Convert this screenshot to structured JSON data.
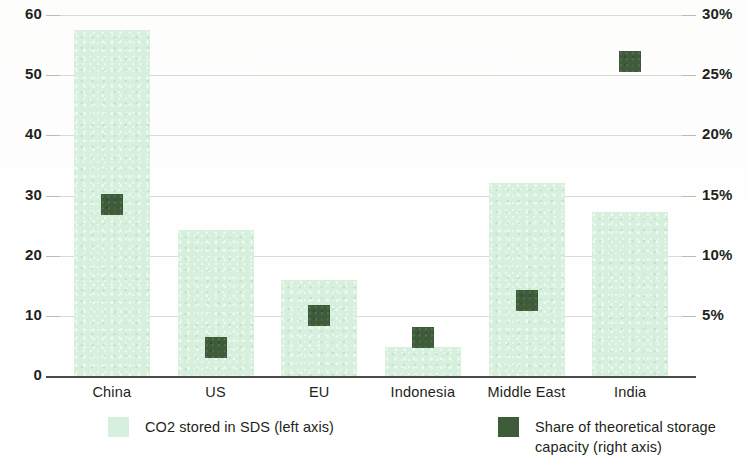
{
  "chart_data": {
    "type": "bar",
    "title": "",
    "subtitle": "",
    "categories": [
      "China",
      "US",
      "EU",
      "Indonesia",
      "Middle East",
      "India"
    ],
    "series": [
      {
        "name": "CO2 stored in SDS (left axis)",
        "axis": "left",
        "type": "bar",
        "color": "#d7f0dd",
        "values": [
          57.5,
          24.2,
          16.0,
          4.8,
          32.0,
          27.2
        ]
      },
      {
        "name": "Share of theoretical storage capacity (right axis)",
        "axis": "right",
        "type": "marker",
        "color": "#3e5c3a",
        "values": [
          14.3,
          2.4,
          5.1,
          3.2,
          6.3,
          26.2
        ]
      }
    ],
    "xlabel": "",
    "ylabel": "GtCO2",
    "ylim": [
      0,
      60
    ],
    "yticks": [
      0,
      10,
      20,
      30,
      40,
      50,
      60
    ],
    "ytick_labels": [
      "0",
      "10",
      "20",
      "30",
      "40",
      "50",
      "60"
    ],
    "y2label": "",
    "y2lim": [
      0,
      30
    ],
    "y2ticks": [
      0,
      5,
      10,
      15,
      20,
      25,
      30
    ],
    "y2tick_labels": [
      "",
      "5%",
      "10%",
      "15%",
      "20%",
      "25%",
      "30%"
    ],
    "grid": true,
    "legend_position": "bottom"
  },
  "legend": {
    "items": [
      {
        "label": "CO2 stored in SDS (left axis)",
        "swatch": "light-green-square",
        "color": "#d7f0dd"
      },
      {
        "label": "Share of theoretical storage\ncapacity (right axis)",
        "swatch": "dark-green-square",
        "color": "#3e5c3a"
      }
    ]
  },
  "axes": {
    "left_title": "GtCO2"
  }
}
